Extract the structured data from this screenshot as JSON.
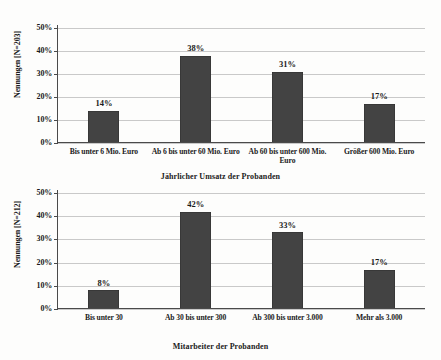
{
  "chart_data": [
    {
      "type": "bar",
      "id": "umsatz",
      "title": "",
      "xlabel": "Jährlicher Umsatz der Probanden",
      "ylabel": "Nennungen [N=203]",
      "categories": [
        "Bis unter 6 Mio. Euro",
        "Ab 6 bis unter 60 Mio. Euro",
        "Ab 60 bis unter 600 Mio. Euro",
        "Größer 600 Mio. Euro"
      ],
      "values": [
        14,
        38,
        31,
        17
      ],
      "data_labels": [
        "14%",
        "38%",
        "31%",
        "17%"
      ],
      "ylim": [
        0,
        50
      ],
      "yticks": [
        0,
        10,
        20,
        30,
        40,
        50
      ],
      "ytick_labels": [
        "0%",
        "10%",
        "20%",
        "30%",
        "40%",
        "50%"
      ],
      "grid": true,
      "legend": "none",
      "bar_color": "#434343"
    },
    {
      "type": "bar",
      "id": "mitarbeiter",
      "title": "",
      "xlabel": "Mitarbeiter der Probanden",
      "ylabel": "Nennungen [N=212]",
      "categories": [
        "Bis unter 30",
        "Ab 30 bis unter 300",
        "Ab 300 bis unter 3.000",
        "Mehr als 3.000"
      ],
      "values": [
        8,
        42,
        33,
        17
      ],
      "data_labels": [
        "8%",
        "42%",
        "33%",
        "17%"
      ],
      "ylim": [
        0,
        50
      ],
      "yticks": [
        0,
        10,
        20,
        30,
        40,
        50
      ],
      "ytick_labels": [
        "0%",
        "10%",
        "20%",
        "30%",
        "40%",
        "50%"
      ],
      "grid": true,
      "legend": "none",
      "bar_color": "#434343"
    }
  ]
}
